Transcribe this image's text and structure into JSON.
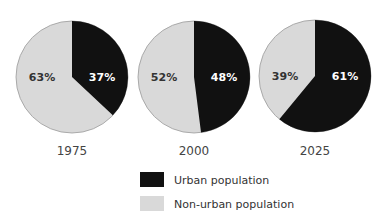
{
  "chart_data": {
    "type": "pie",
    "title": "",
    "legend": [
      {
        "name": "Urban population",
        "color": "#111111"
      },
      {
        "name": "Non-urban population",
        "color": "#d9d9d9"
      }
    ],
    "pies": [
      {
        "label": "1975",
        "urban": 37,
        "non_urban": 63,
        "urban_label": "37%",
        "non_urban_label": "63%"
      },
      {
        "label": "2000",
        "urban": 48,
        "non_urban": 52,
        "urban_label": "48%",
        "non_urban_label": "52%"
      },
      {
        "label": "2025",
        "urban": 61,
        "non_urban": 39,
        "urban_label": "61%",
        "non_urban_label": "39%"
      }
    ]
  },
  "colors": {
    "urban": "#111111",
    "non_urban": "#d9d9d9",
    "stroke": "#9a9a9a"
  }
}
